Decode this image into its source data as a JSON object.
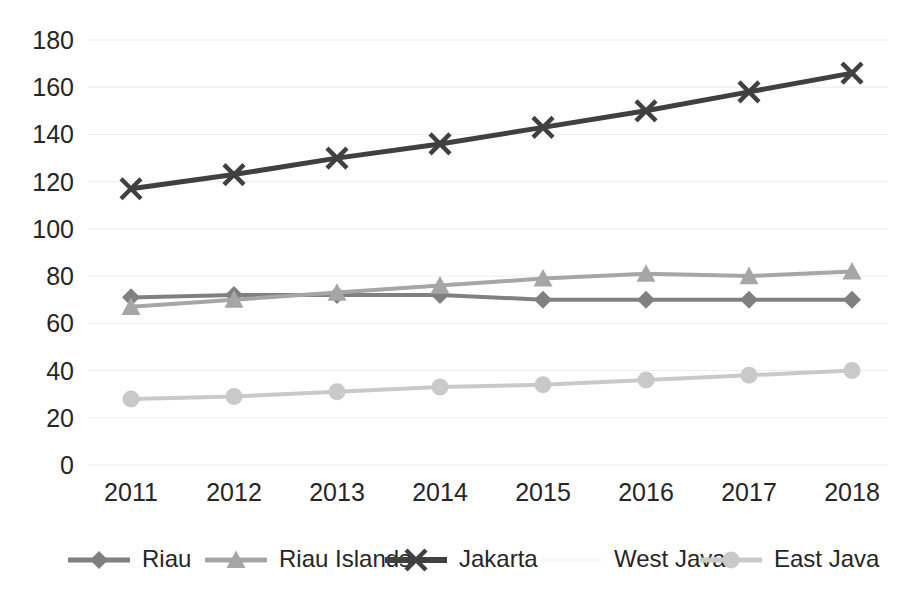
{
  "chart_data": {
    "type": "line",
    "title": "",
    "subtitle": "",
    "xlabel": "",
    "ylabel": "",
    "categories": [
      "2011",
      "2012",
      "2013",
      "2014",
      "2015",
      "2016",
      "2017",
      "2018"
    ],
    "x": [
      2011,
      2012,
      2013,
      2014,
      2015,
      2016,
      2017,
      2018
    ],
    "ylim": [
      0,
      180
    ],
    "yticks": [
      0,
      20,
      40,
      60,
      80,
      100,
      120,
      140,
      160,
      180
    ],
    "ytick_labels": [
      "0",
      "20",
      "40",
      "60",
      "80",
      "100",
      "120",
      "140",
      "160",
      "180"
    ],
    "grid": true,
    "grid_axis": "y",
    "legend_position": "bottom",
    "series": [
      {
        "name": "Riau",
        "marker": "diamond",
        "color": "#808080",
        "line_width": 4,
        "values": [
          71,
          72,
          72,
          72,
          70,
          70,
          70,
          70
        ]
      },
      {
        "name": "Riau Islands",
        "marker": "triangle",
        "color": "#A6A6A6",
        "line_width": 4,
        "values": [
          67,
          70,
          73,
          76,
          79,
          81,
          80,
          82
        ]
      },
      {
        "name": "Jakarta",
        "marker": "x",
        "color": "#404040",
        "line_width": 5,
        "values": [
          117,
          123,
          130,
          136,
          143,
          150,
          158,
          166
        ]
      },
      {
        "name": "West Java",
        "marker": "none",
        "color": "#FAFAFA",
        "line_width": 4,
        "values": [
          null,
          null,
          null,
          null,
          null,
          null,
          null,
          null
        ]
      },
      {
        "name": "East Java",
        "marker": "circle",
        "color": "#C9C9C9",
        "line_width": 4,
        "values": [
          28,
          29,
          31,
          33,
          34,
          36,
          38,
          40
        ]
      }
    ]
  },
  "legend": {
    "entries": [
      {
        "label": "Riau",
        "marker": "diamond",
        "color": "#808080"
      },
      {
        "label": "Riau Islands",
        "marker": "triangle",
        "color": "#A6A6A6"
      },
      {
        "label": "Jakarta",
        "marker": "x",
        "color": "#404040"
      },
      {
        "label": "West Java",
        "marker": "none",
        "color": "#FAFAFA"
      },
      {
        "label": "East Java",
        "marker": "circle",
        "color": "#C9C9C9"
      }
    ]
  },
  "axes": {
    "y_tick_labels": [
      "180",
      "160",
      "140",
      "120",
      "100",
      "80",
      "60",
      "40",
      "20",
      "0"
    ],
    "x_tick_labels": [
      "2011",
      "2012",
      "2013",
      "2014",
      "2015",
      "2016",
      "2017",
      "2018"
    ]
  },
  "colors": {
    "grid": "#EDEDED",
    "background": "#FFFFFF",
    "text": "#262626"
  }
}
